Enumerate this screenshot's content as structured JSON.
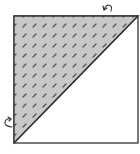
{
  "diagram": {
    "square": {
      "x": 14,
      "y": 16,
      "size": 124,
      "stroke": "#333333"
    },
    "shaded_triangle": {
      "fill": "#c8c8c8",
      "hatch_color": "#555555"
    },
    "arrows": [
      {
        "name": "fold-arrow-top-right",
        "position": "top-right",
        "direction": "curving down-left"
      },
      {
        "name": "fold-arrow-bottom-left",
        "position": "bottom-left",
        "direction": "curving right"
      }
    ]
  }
}
